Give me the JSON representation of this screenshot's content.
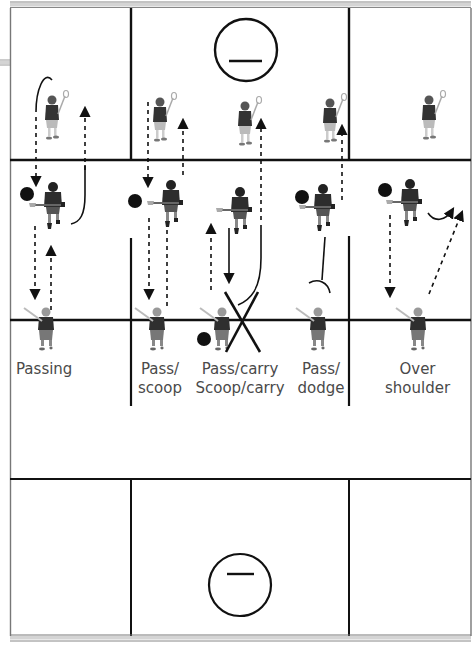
{
  "diagram": {
    "type": "lacrosse-field-drill",
    "colors": {
      "line": "#111111",
      "border_gray": "#9a9a9a",
      "player_dark": "#333333",
      "player_light": "#8a8a8a",
      "ball": "#111111",
      "label_text": "#4a4a4a"
    },
    "drills": [
      {
        "id": "passing",
        "label_lines": [
          "Passing"
        ]
      },
      {
        "id": "pass-scoop",
        "label_lines": [
          "Pass/",
          "scoop"
        ]
      },
      {
        "id": "pass-carry-scoop-carry",
        "label_lines": [
          "Pass/carry",
          "Scoop/carry"
        ]
      },
      {
        "id": "pass-dodge",
        "label_lines": [
          "Pass/",
          "dodge"
        ]
      },
      {
        "id": "over-shoulder",
        "label_lines": [
          "Over",
          "shoulder"
        ]
      }
    ],
    "creases": [
      {
        "position": "top",
        "symbol": "minus"
      },
      {
        "position": "bottom",
        "symbol": "minus"
      }
    ],
    "players": {
      "top_row_count": 5,
      "middle_row_count": 5,
      "bottom_row_count": 5
    },
    "balls_count": 6
  }
}
